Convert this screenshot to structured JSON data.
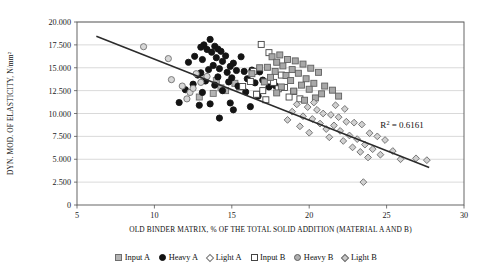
{
  "chart_data": {
    "type": "scatter",
    "title": "",
    "xlabel": "OLD BINDER MATRIX, % OF THE TOTAL SOLID ADDITION (MATERIAL A AND B)",
    "ylabel": "DYN. MOD. OF ELASTICITY, N/mm²",
    "xlim": [
      5,
      30
    ],
    "ylim": [
      0,
      20000
    ],
    "xticks": [
      "5",
      "10",
      "15",
      "20",
      "25",
      "30"
    ],
    "yticks": [
      "0",
      "2.500",
      "5.000",
      "7.500",
      "10.000",
      "12.500",
      "15.000",
      "17.500",
      "20.000"
    ],
    "grid": true,
    "legend_position": "bottom",
    "annotation": {
      "text": "R",
      "sup": "2",
      "rest": "= 0.6161",
      "full": "R² = 0.6161",
      "x": 26.0,
      "y": 8400
    },
    "trendline": {
      "x0": 6.25,
      "y0": 18450,
      "x1": 27.75,
      "y1": 4100,
      "color": "#2b2b2b"
    },
    "series": [
      {
        "name": "Input A",
        "marker": "square",
        "fill": "#b4b4b4",
        "stroke": "#6e6e6e",
        "points": [
          [
            14.0,
            13600
          ],
          [
            14.3,
            12800
          ],
          [
            15.2,
            13300
          ],
          [
            14.6,
            12500
          ],
          [
            13.8,
            12200
          ],
          [
            12.9,
            11800
          ],
          [
            15.5,
            12900
          ],
          [
            13.2,
            13900
          ]
        ]
      },
      {
        "name": "Heavy A",
        "marker": "circle",
        "fill": "#141414",
        "stroke": "#141414",
        "points": [
          [
            13.6,
            18100
          ],
          [
            13.2,
            17500
          ],
          [
            13.0,
            17250
          ],
          [
            13.4,
            17000
          ],
          [
            13.9,
            17350
          ],
          [
            14.1,
            17050
          ],
          [
            13.7,
            16700
          ],
          [
            14.3,
            16800
          ],
          [
            12.6,
            16250
          ],
          [
            14.0,
            16100
          ],
          [
            14.6,
            16300
          ],
          [
            15.6,
            16200
          ],
          [
            13.1,
            15900
          ],
          [
            14.4,
            15700
          ],
          [
            12.2,
            15600
          ],
          [
            15.1,
            15500
          ],
          [
            13.8,
            15250
          ],
          [
            14.9,
            15150
          ],
          [
            14.2,
            14900
          ],
          [
            13.5,
            14800
          ],
          [
            15.3,
            14700
          ],
          [
            14.7,
            14500
          ],
          [
            13.0,
            14450
          ],
          [
            15.8,
            14600
          ],
          [
            16.3,
            14750
          ],
          [
            16.8,
            14550
          ],
          [
            12.8,
            14200
          ],
          [
            14.1,
            14000
          ],
          [
            15.0,
            13900
          ],
          [
            16.0,
            13800
          ],
          [
            13.3,
            13550
          ],
          [
            14.8,
            13450
          ],
          [
            17.0,
            13650
          ],
          [
            12.5,
            13200
          ],
          [
            13.9,
            13100
          ],
          [
            15.4,
            13000
          ],
          [
            16.5,
            13350
          ],
          [
            12.0,
            12600
          ],
          [
            14.4,
            12500
          ],
          [
            13.1,
            12300
          ],
          [
            15.9,
            12350
          ],
          [
            17.4,
            12900
          ],
          [
            11.6,
            11200
          ],
          [
            13.6,
            11050
          ],
          [
            14.9,
            11150
          ],
          [
            12.9,
            10900
          ],
          [
            16.2,
            10750
          ],
          [
            15.1,
            10400
          ],
          [
            14.2,
            9500
          ],
          [
            17.8,
            13050
          ],
          [
            16.7,
            11900
          ]
        ]
      },
      {
        "name": "Light A",
        "marker": "circle-open",
        "fill": "#d7d7d7",
        "stroke": "#707070",
        "points": [
          [
            9.3,
            17300
          ],
          [
            10.9,
            16000
          ],
          [
            11.1,
            13700
          ],
          [
            12.3,
            12300
          ],
          [
            12.1,
            11600
          ],
          [
            13.0,
            13400
          ],
          [
            13.4,
            14050
          ],
          [
            12.7,
            14350
          ],
          [
            11.8,
            13000
          ],
          [
            12.5,
            12750
          ]
        ]
      },
      {
        "name": "Input B",
        "marker": "square-open",
        "fill": "#ffffff",
        "stroke": "#444444",
        "points": [
          [
            16.9,
            17550
          ],
          [
            17.4,
            16650
          ],
          [
            16.2,
            13500
          ],
          [
            15.7,
            12950
          ],
          [
            17.0,
            12500
          ],
          [
            18.0,
            12700
          ],
          [
            17.7,
            13400
          ],
          [
            18.4,
            12850
          ],
          [
            16.6,
            12100
          ],
          [
            19.0,
            12400
          ],
          [
            18.7,
            11800
          ],
          [
            17.2,
            11500
          ],
          [
            19.4,
            11600
          ],
          [
            16.4,
            14600
          ],
          [
            18.2,
            14200
          ]
        ]
      },
      {
        "name": "Heavy B",
        "marker": "square",
        "fill": "#a8a8a8",
        "stroke": "#606060",
        "points": [
          [
            17.6,
            16200
          ],
          [
            18.1,
            16400
          ],
          [
            18.6,
            15900
          ],
          [
            17.9,
            15600
          ],
          [
            19.1,
            15750
          ],
          [
            18.3,
            15200
          ],
          [
            17.3,
            15050
          ],
          [
            19.6,
            15400
          ],
          [
            18.9,
            14800
          ],
          [
            17.8,
            14600
          ],
          [
            20.1,
            14950
          ],
          [
            19.3,
            14400
          ],
          [
            18.5,
            14150
          ],
          [
            17.5,
            13950
          ],
          [
            20.6,
            14500
          ],
          [
            19.8,
            13800
          ],
          [
            18.8,
            13600
          ],
          [
            17.1,
            13450
          ],
          [
            20.3,
            13300
          ],
          [
            19.5,
            13100
          ],
          [
            18.2,
            12900
          ],
          [
            21.0,
            13000
          ],
          [
            20.0,
            12650
          ],
          [
            19.0,
            12450
          ],
          [
            17.9,
            12250
          ],
          [
            21.5,
            12550
          ],
          [
            20.8,
            12150
          ],
          [
            16.8,
            15000
          ],
          [
            16.3,
            14350
          ],
          [
            21.9,
            11900
          ],
          [
            20.4,
            11700
          ],
          [
            19.7,
            11450
          ]
        ]
      },
      {
        "name": "Light B",
        "marker": "diamond",
        "fill": "#d0d0d0",
        "stroke": "#6a6a6a",
        "points": [
          [
            19.2,
            11000
          ],
          [
            19.9,
            10700
          ],
          [
            20.5,
            10400
          ],
          [
            18.9,
            10200
          ],
          [
            20.9,
            10000
          ],
          [
            19.6,
            9700
          ],
          [
            21.4,
            9850
          ],
          [
            20.2,
            9400
          ],
          [
            21.9,
            9600
          ],
          [
            18.6,
            9300
          ],
          [
            22.4,
            9100
          ],
          [
            20.7,
            8900
          ],
          [
            21.6,
            8700
          ],
          [
            19.4,
            8600
          ],
          [
            22.9,
            9000
          ],
          [
            21.1,
            8300
          ],
          [
            23.4,
            8800
          ],
          [
            22.0,
            8100
          ],
          [
            20.0,
            7900
          ],
          [
            23.9,
            7850
          ],
          [
            22.6,
            7600
          ],
          [
            21.3,
            7400
          ],
          [
            24.4,
            7500
          ],
          [
            23.1,
            7200
          ],
          [
            22.2,
            7000
          ],
          [
            24.9,
            7100
          ],
          [
            23.6,
            6600
          ],
          [
            22.8,
            6300
          ],
          [
            24.1,
            6100
          ],
          [
            23.3,
            5800
          ],
          [
            25.4,
            5900
          ],
          [
            24.6,
            5500
          ],
          [
            23.8,
            5200
          ],
          [
            25.9,
            5000
          ],
          [
            26.9,
            5100
          ],
          [
            27.6,
            4900
          ],
          [
            23.5,
            2500
          ],
          [
            21.7,
            10900
          ],
          [
            22.3,
            10500
          ],
          [
            20.3,
            11200
          ]
        ]
      }
    ]
  },
  "legend": {
    "items": [
      {
        "label": "Input A",
        "marker_name": "square-grey-marker"
      },
      {
        "label": "Heavy A",
        "marker_name": "circle-black-marker"
      },
      {
        "label": "Light A",
        "marker_name": "diamond-open-marker"
      },
      {
        "label": "Input B",
        "marker_name": "square-open-marker"
      },
      {
        "label": "Heavy B",
        "marker_name": "circle-grey-marker"
      },
      {
        "label": "Light B",
        "marker_name": "diamond-grey-marker"
      }
    ]
  }
}
